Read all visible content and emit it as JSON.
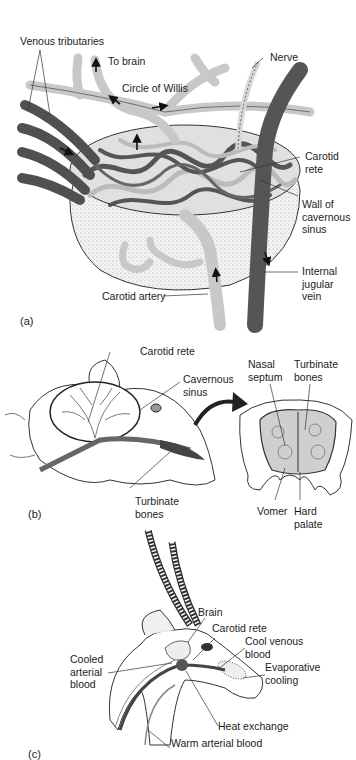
{
  "figure": {
    "panels": [
      {
        "id": "a",
        "tag": "(a)",
        "labels": {
          "venous_tributaries": "Venous tributaries",
          "to_brain": "To brain",
          "circle_of_willis": "Circle of Willis",
          "nerve": "Nerve",
          "carotid_rete": "Carotid\nrete",
          "wall_of_cavernous_sinus": "Wall of\ncavernous\nsinus",
          "internal_jugular_vein": "Internal\njugular\nvein",
          "carotid_artery": "Carotid artery"
        }
      },
      {
        "id": "b",
        "tag": "(b)",
        "labels": {
          "carotid_rete": "Carotid rete",
          "cavernous_sinus": "Cavernous\nsinus",
          "turbinate_bones_left": "Turbinate\nbones",
          "nasal_septum": "Nasal\nseptum",
          "turbinate_bones_right": "Turbinate\nbones",
          "vomer": "Vomer",
          "hard_palate": "Hard\npalate"
        }
      },
      {
        "id": "c",
        "tag": "(c)",
        "labels": {
          "brain": "Brain",
          "carotid_rete": "Carotid rete",
          "cool_venous_blood": "Cool venous\nblood",
          "cooled_arterial_blood": "Cooled\narterial\nblood",
          "evaporative_cooling": "Evaporative\ncooling",
          "heat_exchange": "Heat exchange",
          "warm_arterial_blood": "Warm arterial blood"
        }
      }
    ],
    "colors": {
      "artery": "#c9c9c9",
      "vein": "#555555",
      "outline": "#333333",
      "background": "#ffffff"
    }
  }
}
